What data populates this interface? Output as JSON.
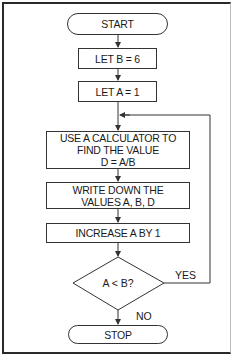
{
  "flowchart": {
    "nodes": {
      "start": "START",
      "let_b": "LET B = 6",
      "let_a": "LET A = 1",
      "calc_line1": "USE A CALCULATOR TO",
      "calc_line2": "FIND THE VALUE",
      "calc_line3": "D = A/B",
      "write_line1": "WRITE DOWN THE",
      "write_line2": "VALUES A, B, D",
      "increase": "INCREASE A BY 1",
      "decision": "A < B?",
      "stop": "STOP"
    },
    "edge_labels": {
      "yes": "YES",
      "no": "NO"
    },
    "colors": {
      "line": "#333333",
      "background": "#ffffff",
      "frame": "#2a2a2a"
    }
  }
}
